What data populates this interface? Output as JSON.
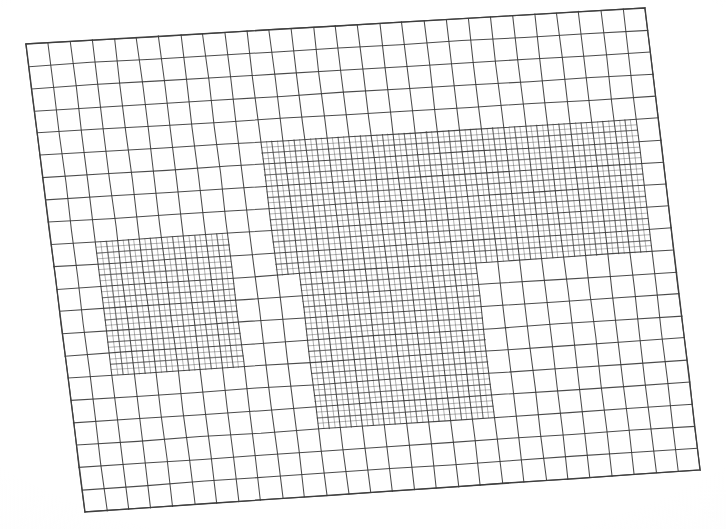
{
  "figure": {
    "type": "mesh-plot",
    "background_color": "#ffffff",
    "line_color": "#3c3c3c",
    "line_color_refined": "#4a4a4a",
    "base_line_width": 1.05,
    "refined_line_width": 0.85,
    "canvas": {
      "width": 726,
      "height": 529
    }
  },
  "chart_data": {
    "type": "mesh",
    "title": "",
    "subtitle": "",
    "xlabel": "",
    "ylabel": "",
    "grid": "on",
    "legend": "none",
    "annotations": [],
    "domain_quad": {
      "top_left": [
        26,
        44
      ],
      "top_right": [
        645,
        8
      ],
      "bottom_right": [
        700,
        470
      ],
      "bottom_left": [
        85,
        512
      ]
    },
    "base_grid": {
      "columns": 28,
      "rows": 21,
      "cell_width_px": 22,
      "cell_height_px": 22,
      "refinement_ratio": 2
    },
    "refined_patches": [
      {
        "name": "left-patch",
        "level": 1,
        "col_start": 2,
        "col_end": 8,
        "row_start": 9,
        "row_end": 15,
        "sublevels": [
          {
            "level": 2,
            "col_start": 2,
            "col_end": 8,
            "row_start": 9,
            "row_end": 15
          }
        ]
      },
      {
        "name": "main-patch-upper",
        "level": 1,
        "col_start": 10,
        "col_end": 27,
        "row_start": 5,
        "row_end": 11,
        "sublevels": [
          {
            "level": 2,
            "col_start": 10,
            "col_end": 27,
            "row_start": 5,
            "row_end": 11
          }
        ]
      },
      {
        "name": "main-patch-lower",
        "level": 1,
        "col_start": 11,
        "col_end": 19,
        "row_start": 11,
        "row_end": 18,
        "sublevels": [
          {
            "level": 2,
            "col_start": 11,
            "col_end": 19,
            "row_start": 11,
            "row_end": 18
          }
        ]
      }
    ],
    "x": [],
    "values": []
  }
}
